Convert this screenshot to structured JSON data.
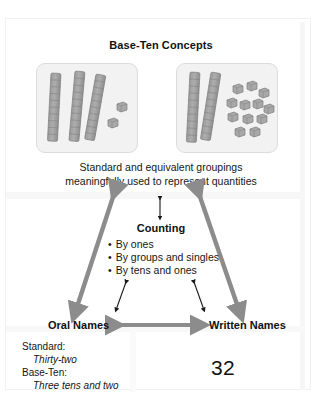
{
  "diagram": {
    "title": "Base-Ten Concepts",
    "caption_line1": "Standard and equivalent groupings",
    "caption_line2": "meaningfully used to represent quantities",
    "models": {
      "left": {
        "name": "standard-grouping-model",
        "rods": 3,
        "singles": 2,
        "value": 32
      },
      "right": {
        "name": "equivalent-grouping-model",
        "rods": 2,
        "singles": 12,
        "value": 32
      }
    },
    "counting": {
      "title": "Counting",
      "items": [
        "By ones",
        "By groups and singles",
        "By tens and ones"
      ]
    },
    "oral_names": {
      "label": "Oral Names",
      "standard_lead": "Standard:",
      "standard_value": "Thirty-two",
      "baseten_lead": "Base-Ten:",
      "baseten_value": "Three tens and two"
    },
    "written_names": {
      "label": "Written Names",
      "numeral": "32"
    },
    "colors": {
      "big_arrow": "#8c8c8c",
      "small_arrow": "#1a1a1a",
      "block": "#a0a0a0",
      "block_edge": "#7e7e7e",
      "panel_bg": "#f2f2f2",
      "panel_border": "#dcdcdc",
      "text": "#161616"
    },
    "arrows": [
      {
        "name": "arrow-base-ten-to-oral-names",
        "style": "thick-gray",
        "direction": "double"
      },
      {
        "name": "arrow-base-ten-to-written-names",
        "style": "thick-gray",
        "direction": "double"
      },
      {
        "name": "arrow-base-ten-to-counting",
        "style": "thin-black",
        "direction": "double"
      },
      {
        "name": "arrow-counting-to-oral-names",
        "style": "thin-black",
        "direction": "double"
      },
      {
        "name": "arrow-counting-to-written-names",
        "style": "thin-black",
        "direction": "double"
      },
      {
        "name": "arrow-oral-to-written-names",
        "style": "thick-gray",
        "direction": "double"
      }
    ]
  }
}
